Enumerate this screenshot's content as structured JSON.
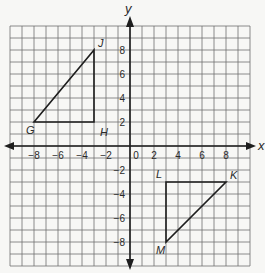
{
  "diagram": {
    "type": "coordinate-plane",
    "axes": {
      "x_label": "x",
      "y_label": "y",
      "range": [
        -10,
        10
      ],
      "grid_step": 1,
      "x_ticks": [
        "−8",
        "−6",
        "−4",
        "−2",
        "0",
        "2",
        "4",
        "6",
        "8"
      ],
      "x_tick_values": [
        -8,
        -6,
        -4,
        -2,
        0,
        2,
        4,
        6,
        8
      ],
      "y_ticks": [
        "8",
        "6",
        "4",
        "2",
        "−2",
        "−4",
        "−6",
        "−8"
      ],
      "y_tick_values": [
        8,
        6,
        4,
        2,
        -2,
        -4,
        -6,
        -8
      ]
    },
    "triangles": [
      {
        "name": "GHJ",
        "vertices": [
          {
            "label": "G",
            "x": -8,
            "y": 2
          },
          {
            "label": "H",
            "x": -3,
            "y": 2
          },
          {
            "label": "J",
            "x": -3,
            "y": 8
          }
        ]
      },
      {
        "name": "LKM",
        "vertices": [
          {
            "label": "L",
            "x": 3,
            "y": -3
          },
          {
            "label": "K",
            "x": 8,
            "y": -3
          },
          {
            "label": "M",
            "x": 3,
            "y": -8
          }
        ]
      }
    ],
    "colors": {
      "background": "#f7f7f5",
      "grid": "#6e6e6e",
      "axis": "#1e1e1e",
      "shape": "#1e1e1e"
    }
  }
}
